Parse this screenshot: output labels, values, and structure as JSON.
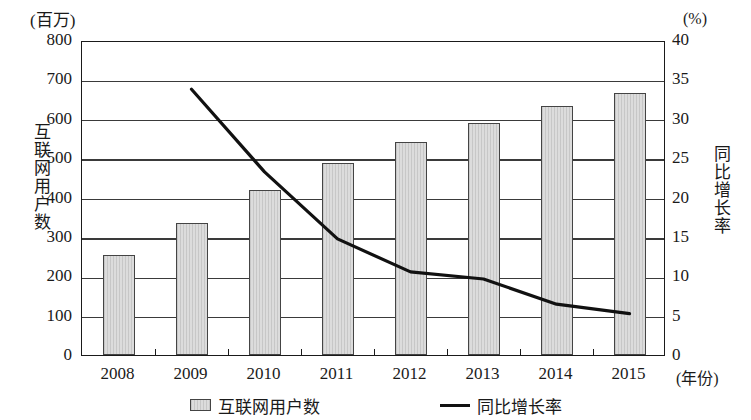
{
  "chart_data": {
    "type": "bar",
    "title": "",
    "subtitle": "",
    "categories": [
      "2008",
      "2009",
      "2010",
      "2011",
      "2012",
      "2013",
      "2014",
      "2015"
    ],
    "xlabel": "(年份)",
    "grid": true,
    "legend_position": "bottom",
    "series": [
      {
        "name": "互联网用户数",
        "type": "bar",
        "axis": "left",
        "unit": "(百万)",
        "values": [
          255,
          335,
          420,
          487,
          540,
          590,
          632,
          665
        ]
      },
      {
        "name": "同比增长率",
        "type": "line",
        "axis": "right",
        "unit": "(%)",
        "values": [
          null,
          34.0,
          23.5,
          15.0,
          10.8,
          9.9,
          6.7,
          5.5
        ]
      }
    ],
    "y_axis_left": {
      "label": "互联网用户数",
      "unit": "(百万)",
      "ylim": [
        0,
        800
      ],
      "ticks": [
        0,
        100,
        200,
        300,
        400,
        500,
        600,
        700,
        800
      ],
      "tick_labels": [
        "0",
        "100",
        "200",
        "300",
        "400",
        "500",
        "600",
        "700",
        "800"
      ]
    },
    "y_axis_right": {
      "label": "同比增长率",
      "unit": "(%)",
      "ylim": [
        0,
        40
      ],
      "ticks": [
        0,
        5,
        10,
        15,
        20,
        25,
        30,
        35,
        40
      ],
      "tick_labels": [
        "0",
        "5",
        "10",
        "15",
        "20",
        "25",
        "30",
        "35",
        "40"
      ]
    },
    "legend": [
      {
        "label": "互联网用户数",
        "marker": "bar-swatch"
      },
      {
        "label": "同比增长率",
        "marker": "line-swatch"
      }
    ],
    "colors": {
      "bar_fill": "#dcdcdc",
      "bar_border": "#444444",
      "line": "#111111",
      "grid": "#3a3a3a",
      "axis": "#1a1a1a",
      "text": "#1a1a1a",
      "background": "#ffffff"
    }
  }
}
